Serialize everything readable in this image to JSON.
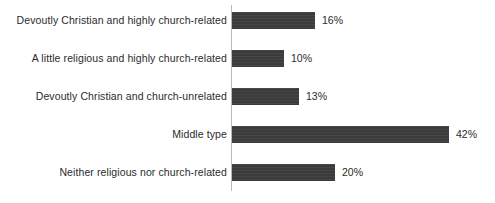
{
  "chart_data": {
    "type": "bar",
    "orientation": "horizontal",
    "title": "",
    "xlabel": "",
    "ylabel": "",
    "grid": false,
    "legend": null,
    "xlim": [
      0,
      42
    ],
    "categories": [
      "Devoutly Christian and highly church-related",
      "A little religious and highly church-related",
      "Devoutly Christian and church-unrelated",
      "Middle type",
      "Neither religious nor church-related"
    ],
    "values": [
      16,
      10,
      13,
      42,
      20
    ],
    "value_labels": [
      "16%",
      "10%",
      "13%",
      "42%",
      "20%"
    ],
    "bar_color": "#3b3b3b",
    "axis_color": "#b9b9b9",
    "text_color": "#2b2b2b",
    "background": "#ffffff"
  }
}
